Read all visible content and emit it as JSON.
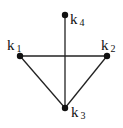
{
  "diagram": {
    "type": "graph",
    "nodes": [
      {
        "id": "k1",
        "label": "k",
        "sub": "1",
        "x": 20,
        "y": 56
      },
      {
        "id": "k2",
        "label": "k",
        "sub": "2",
        "x": 107,
        "y": 56
      },
      {
        "id": "k3",
        "label": "k",
        "sub": "3",
        "x": 65,
        "y": 108
      },
      {
        "id": "k4",
        "label": "k",
        "sub": "4",
        "x": 65,
        "y": 15
      }
    ],
    "edges": [
      [
        "k1",
        "k2"
      ],
      [
        "k1",
        "k3"
      ],
      [
        "k2",
        "k3"
      ],
      [
        "k4",
        "k3"
      ]
    ],
    "colors": {
      "line": "#222222",
      "node": "#111111",
      "background": "#ffffff"
    }
  }
}
